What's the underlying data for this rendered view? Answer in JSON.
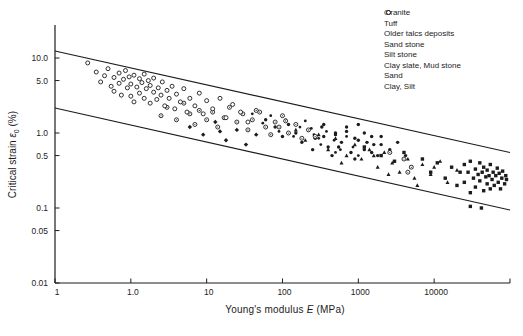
{
  "figure": {
    "background": "#ffffff",
    "ink": "#1c1c1c"
  },
  "chart_data": {
    "type": "scatter",
    "title": "",
    "xlabel": "Young's modulus E (MPa)",
    "ylabel": "Critical strain ε0 (%)",
    "xlabel_parts": {
      "prefix": "Young's modulus ",
      "symbol": "E",
      "suffix": " (MPa)"
    },
    "ylabel_parts": {
      "prefix": "Critical strain ",
      "symbol": "ε",
      "subscript": "0",
      "suffix": " (%)"
    },
    "x_axis": {
      "scale": "log",
      "range_MPa": [
        0.1,
        100000
      ],
      "tick_labels": [
        "1",
        "1.0",
        "10",
        "100",
        "1000",
        "10000"
      ],
      "tick_values_MPa": [
        0.1,
        1,
        10,
        100,
        1000,
        10000
      ],
      "end_tick_value_MPa": 100000,
      "grid": false
    },
    "y_axis": {
      "scale": "log",
      "range_pct": [
        0.01,
        27
      ],
      "tick_labels": [
        "10.0",
        "5.0",
        "1.0",
        "0.5",
        "0.1",
        "0.05",
        "0.01"
      ],
      "tick_values_pct": [
        10,
        5,
        1,
        0.5,
        0.1,
        0.05,
        0.01
      ],
      "grid": false
    },
    "legend_position": "top-right",
    "bound_lines": {
      "upper": [
        [
          0.1,
          12.4
        ],
        [
          100000,
          0.55
        ]
      ],
      "lower": [
        [
          0.1,
          2.15
        ],
        [
          100000,
          0.094
        ]
      ]
    },
    "series": [
      {
        "name": "Granite",
        "marker": "filled-square",
        "points": [
          [
            1200,
            0.65
          ],
          [
            2000,
            0.5
          ],
          [
            3000,
            0.42
          ],
          [
            4000,
            0.55
          ],
          [
            5000,
            0.35
          ],
          [
            7000,
            0.45
          ],
          [
            9000,
            0.3
          ],
          [
            11000,
            0.4
          ],
          [
            14000,
            0.25
          ],
          [
            17000,
            0.35
          ],
          [
            20000,
            0.2
          ],
          [
            22000,
            0.3
          ],
          [
            25000,
            0.38
          ],
          [
            25000,
            0.22
          ],
          [
            28000,
            0.3
          ],
          [
            30000,
            0.16
          ],
          [
            30000,
            0.42
          ],
          [
            33000,
            0.25
          ],
          [
            35000,
            0.33
          ],
          [
            35000,
            0.19
          ],
          [
            38000,
            0.28
          ],
          [
            40000,
            0.4
          ],
          [
            40000,
            0.23
          ],
          [
            43000,
            0.3
          ],
          [
            45000,
            0.17
          ],
          [
            45000,
            0.35
          ],
          [
            48000,
            0.26
          ],
          [
            50000,
            0.21
          ],
          [
            50000,
            0.32
          ],
          [
            53000,
            0.27
          ],
          [
            55000,
            0.18
          ],
          [
            55000,
            0.38
          ],
          [
            58000,
            0.24
          ],
          [
            60000,
            0.3
          ],
          [
            62000,
            0.2
          ],
          [
            65000,
            0.27
          ],
          [
            68000,
            0.34
          ],
          [
            70000,
            0.22
          ],
          [
            72000,
            0.29
          ],
          [
            75000,
            0.18
          ],
          [
            78000,
            0.25
          ],
          [
            80000,
            0.31
          ],
          [
            85000,
            0.21
          ],
          [
            88000,
            0.27
          ],
          [
            90000,
            0.24
          ],
          [
            30000,
            0.105
          ],
          [
            42000,
            0.1
          ]
        ]
      },
      {
        "name": "Tuff",
        "marker": "filled-circle",
        "points": [
          [
            350,
            1.3
          ],
          [
            500,
            1.0
          ],
          [
            700,
            1.2
          ],
          [
            900,
            0.85
          ],
          [
            1200,
            1.0
          ],
          [
            1600,
            0.7
          ],
          [
            2000,
            0.9
          ],
          [
            2600,
            0.6
          ],
          [
            3300,
            0.75
          ],
          [
            4200,
            0.5
          ],
          [
            1000,
            1.3
          ],
          [
            1500,
            0.55
          ]
        ]
      },
      {
        "name": "Older talcs deposits",
        "marker": "filled-diamond",
        "points": [
          [
            6,
            1.2
          ],
          [
            9,
            0.95
          ],
          [
            13,
            1.4
          ],
          [
            18,
            0.8
          ],
          [
            25,
            1.1
          ],
          [
            33,
            0.7
          ],
          [
            45,
            0.95
          ],
          [
            15,
            1.05
          ]
        ]
      },
      {
        "name": "Sand stone",
        "marker": "filled-circle",
        "points": [
          [
            60,
            1.5
          ],
          [
            80,
            1.2
          ],
          [
            100,
            0.9
          ],
          [
            120,
            1.3
          ],
          [
            150,
            1.0
          ],
          [
            180,
            0.75
          ],
          [
            220,
            1.1
          ],
          [
            270,
            0.85
          ],
          [
            330,
            1.2
          ],
          [
            400,
            0.65
          ],
          [
            500,
            0.95
          ],
          [
            600,
            0.75
          ],
          [
            700,
            1.05
          ],
          [
            800,
            0.55
          ],
          [
            1000,
            0.8
          ],
          [
            1200,
            0.6
          ],
          [
            1500,
            0.9
          ],
          [
            1800,
            0.5
          ],
          [
            2000,
            0.7
          ],
          [
            250,
            0.6
          ],
          [
            350,
            0.9
          ],
          [
            450,
            0.5
          ],
          [
            550,
            0.65
          ],
          [
            900,
            0.45
          ],
          [
            1300,
            0.75
          ]
        ]
      },
      {
        "name": "Silt stone",
        "marker": "filled-circle-small",
        "points": [
          [
            40,
            1.8
          ],
          [
            55,
            1.35
          ],
          [
            70,
            1.7
          ],
          [
            90,
            1.05
          ],
          [
            110,
            1.5
          ],
          [
            140,
            0.9
          ],
          [
            170,
            1.2
          ],
          [
            200,
            1.45
          ],
          [
            260,
            0.95
          ],
          [
            320,
            0.7
          ],
          [
            380,
            1.05
          ],
          [
            480,
            0.8
          ],
          [
            580,
            0.6
          ],
          [
            700,
            0.9
          ],
          [
            850,
            0.65
          ],
          [
            1000,
            0.5
          ],
          [
            150,
            1.3
          ],
          [
            240,
            1.15
          ],
          [
            300,
            0.85
          ],
          [
            500,
            0.55
          ]
        ]
      },
      {
        "name": "Clay slate, Mud stone",
        "marker": "filled-triangle",
        "points": [
          [
            150,
            1.1
          ],
          [
            200,
            0.8
          ],
          [
            300,
            0.95
          ],
          [
            400,
            0.6
          ],
          [
            500,
            0.85
          ],
          [
            700,
            0.5
          ],
          [
            900,
            0.7
          ],
          [
            1100,
            0.45
          ],
          [
            1400,
            0.6
          ],
          [
            1800,
            0.35
          ],
          [
            2200,
            0.55
          ],
          [
            2800,
            0.4
          ],
          [
            3500,
            0.3
          ],
          [
            4500,
            0.45
          ],
          [
            5500,
            0.25
          ],
          [
            7000,
            0.38
          ],
          [
            9000,
            0.28
          ],
          [
            12000,
            0.42
          ],
          [
            15000,
            0.22
          ],
          [
            20000,
            0.32
          ],
          [
            600,
            0.4
          ],
          [
            1600,
            0.5
          ],
          [
            2500,
            0.28
          ],
          [
            6000,
            0.2
          ],
          [
            10000,
            0.35
          ]
        ]
      },
      {
        "name": "Sand",
        "marker": "open-circle-dot",
        "points": [
          [
            2.5,
            1.7
          ],
          [
            3,
            2.2
          ],
          [
            4,
            1.5
          ],
          [
            5,
            2.5
          ],
          [
            6,
            1.8
          ],
          [
            7,
            1.3
          ],
          [
            8,
            2.0
          ],
          [
            10,
            1.5
          ],
          [
            12,
            1.9
          ],
          [
            14,
            1.2
          ],
          [
            17,
            1.6
          ],
          [
            20,
            2.2
          ],
          [
            25,
            1.4
          ],
          [
            30,
            1.8
          ],
          [
            35,
            1.1
          ],
          [
            40,
            1.5
          ],
          [
            50,
            1.9
          ],
          [
            60,
            1.2
          ],
          [
            70,
            0.95
          ],
          [
            80,
            1.4
          ],
          [
            100,
            1.7
          ],
          [
            120,
            1.0
          ],
          [
            150,
            1.3
          ],
          [
            180,
            0.85
          ],
          [
            220,
            1.1
          ],
          [
            270,
            0.9
          ],
          [
            45,
            2.0
          ],
          [
            90,
            1.2
          ],
          [
            110,
            1.45
          ],
          [
            4000,
            0.45
          ],
          [
            5000,
            0.35
          ],
          [
            4500,
            0.3
          ],
          [
            2600,
            0.55
          ]
        ]
      },
      {
        "name": "Clay, Silt",
        "marker": "open-circle",
        "points": [
          [
            0.27,
            8.6
          ],
          [
            0.35,
            6.5
          ],
          [
            0.4,
            4.8
          ],
          [
            0.45,
            5.8
          ],
          [
            0.5,
            7.2
          ],
          [
            0.55,
            4.2
          ],
          [
            0.6,
            5.5
          ],
          [
            0.6,
            3.6
          ],
          [
            0.7,
            6.3
          ],
          [
            0.7,
            4.6
          ],
          [
            0.75,
            3.2
          ],
          [
            0.8,
            5.2
          ],
          [
            0.85,
            6.8
          ],
          [
            0.9,
            4.0
          ],
          [
            0.95,
            5.6
          ],
          [
            1.0,
            3.1
          ],
          [
            1.0,
            4.5
          ],
          [
            1.1,
            5.9
          ],
          [
            1.1,
            2.6
          ],
          [
            1.2,
            4.1
          ],
          [
            1.3,
            5.3
          ],
          [
            1.3,
            3.4
          ],
          [
            1.4,
            4.7
          ],
          [
            1.5,
            2.9
          ],
          [
            1.5,
            6.1
          ],
          [
            1.6,
            3.9
          ],
          [
            1.7,
            5.0
          ],
          [
            1.8,
            2.5
          ],
          [
            1.8,
            4.3
          ],
          [
            2.0,
            3.5
          ],
          [
            2.0,
            5.4
          ],
          [
            2.2,
            2.8
          ],
          [
            2.3,
            4.0
          ],
          [
            2.5,
            3.2
          ],
          [
            2.6,
            4.8
          ],
          [
            2.8,
            2.3
          ],
          [
            3.0,
            3.7
          ],
          [
            3.2,
            2.9
          ],
          [
            3.5,
            4.2
          ],
          [
            3.8,
            2.1
          ],
          [
            4.0,
            3.3
          ],
          [
            4.5,
            2.6
          ],
          [
            5.0,
            3.9
          ],
          [
            5.5,
            1.9
          ],
          [
            6.0,
            2.9
          ],
          [
            7.0,
            2.3
          ],
          [
            8.0,
            3.4
          ],
          [
            9.0,
            1.8
          ],
          [
            10,
            2.7
          ],
          [
            12,
            2.1
          ],
          [
            15,
            2.9
          ],
          [
            18,
            1.6
          ],
          [
            22,
            2.4
          ],
          [
            28,
            1.9
          ],
          [
            35,
            1.4
          ]
        ]
      }
    ]
  }
}
